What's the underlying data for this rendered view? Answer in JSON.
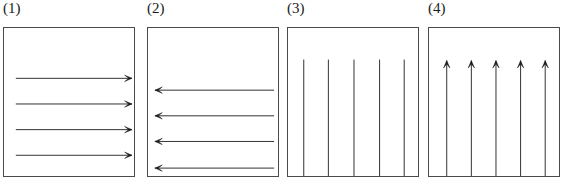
{
  "figure": {
    "type": "vector-field-diagram",
    "background_color": "#ffffff",
    "stroke_color": "#1a1a1a",
    "box_border_color": "#4a4a4a",
    "width": 563,
    "height": 189,
    "panel_count": 4
  },
  "panels": [
    {
      "label": "(1)",
      "direction": "right",
      "arrow_count": 5,
      "orientation": "horizontal",
      "box": {
        "x": 3,
        "y": 27,
        "width": 132,
        "height": 150
      },
      "arrows": [
        {
          "x1": 12,
          "y1": 51,
          "x2": 130,
          "y2": 51
        },
        {
          "x1": 12,
          "y1": 77,
          "x2": 130,
          "y2": 77
        },
        {
          "x1": 12,
          "y1": 103,
          "x2": 130,
          "y2": 103
        },
        {
          "x1": 12,
          "y1": 129,
          "x2": 130,
          "y2": 129
        },
        {
          "x1": 12,
          "y1": 155,
          "x2": 130,
          "y2": 155
        }
      ]
    },
    {
      "label": "(2)",
      "direction": "left",
      "arrow_count": 4,
      "orientation": "horizontal",
      "box": {
        "x": 3,
        "y": 27,
        "width": 132,
        "height": 150
      },
      "arrows": [
        {
          "x1": 128,
          "y1": 63,
          "x2": 7,
          "y2": 63
        },
        {
          "x1": 128,
          "y1": 89,
          "x2": 7,
          "y2": 89
        },
        {
          "x1": 128,
          "y1": 115,
          "x2": 7,
          "y2": 115
        },
        {
          "x1": 128,
          "y1": 142,
          "x2": 7,
          "y2": 142
        }
      ]
    },
    {
      "label": "(3)",
      "direction": "down",
      "arrow_count": 5,
      "orientation": "vertical",
      "box": {
        "x": 3,
        "y": 27,
        "width": 132,
        "height": 150
      },
      "arrows": [
        {
          "x1": 16,
          "y1": 32,
          "x2": 16,
          "y2": 174
        },
        {
          "x1": 41,
          "y1": 32,
          "x2": 41,
          "y2": 174
        },
        {
          "x1": 67,
          "y1": 32,
          "x2": 67,
          "y2": 174
        },
        {
          "x1": 93,
          "y1": 32,
          "x2": 93,
          "y2": 174
        },
        {
          "x1": 118,
          "y1": 32,
          "x2": 118,
          "y2": 174
        }
      ]
    },
    {
      "label": "(4)",
      "direction": "up",
      "arrow_count": 5,
      "orientation": "vertical",
      "box": {
        "x": 3,
        "y": 27,
        "width": 132,
        "height": 150
      },
      "arrows": [
        {
          "x1": 18,
          "y1": 174,
          "x2": 18,
          "y2": 33
        },
        {
          "x1": 43,
          "y1": 174,
          "x2": 43,
          "y2": 33
        },
        {
          "x1": 68,
          "y1": 174,
          "x2": 68,
          "y2": 33
        },
        {
          "x1": 93,
          "y1": 174,
          "x2": 93,
          "y2": 33
        },
        {
          "x1": 118,
          "y1": 174,
          "x2": 118,
          "y2": 33
        }
      ]
    }
  ]
}
